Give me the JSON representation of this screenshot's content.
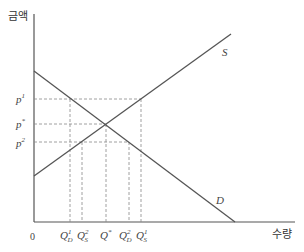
{
  "diagram": {
    "y_axis_label": "금액",
    "x_axis_label": "수량",
    "origin_label": "0",
    "curves": {
      "supply": {
        "label": "S",
        "from": [
          34,
          176
        ],
        "to": [
          231,
          34
        ]
      },
      "demand": {
        "label": "D",
        "from": [
          34,
          71
        ],
        "to": [
          235,
          222
        ]
      }
    },
    "price_labels": {
      "p1": {
        "base": "p",
        "sup": "1"
      },
      "pstar": {
        "base": "p",
        "sup": "*"
      },
      "p2": {
        "base": "p",
        "sup": "2"
      }
    },
    "quantity_labels": {
      "qd1": {
        "base": "Q",
        "sub": "D",
        "sup": "1"
      },
      "qs2": {
        "base": "Q",
        "sub": "S",
        "sup": "2"
      },
      "qstar": {
        "base": "Q",
        "sup": "*"
      },
      "qd2": {
        "base": "Q",
        "sub": "D",
        "sup": "2"
      },
      "qs1": {
        "base": "Q",
        "sub": "S",
        "sup": "1"
      }
    },
    "colors": {
      "axis": "#555555",
      "curve": "#555555",
      "dashed": "#888888"
    }
  }
}
